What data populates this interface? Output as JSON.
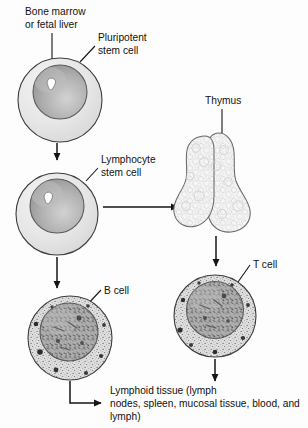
{
  "figure": {
    "background_color": "#fdfdfd",
    "line_color": "#1a1a1a"
  },
  "labels": {
    "bone_marrow_line1": "Bone marrow",
    "bone_marrow_line2": "or fetal liver",
    "pluripotent_line1": "Pluripotent",
    "pluripotent_line2": "stem cell",
    "lymphocyte_line1": "Lymphocyte",
    "lymphocyte_line2": "stem cell",
    "thymus": "Thymus",
    "b_cell": "B cell",
    "t_cell": "T cell",
    "lymphoid_line1": "Lymphoid tissue (lymph",
    "lymphoid_line2": "nodes, spleen, mucosal tissue, blood, and",
    "lymphoid_line3": "lymph)"
  },
  "cells": {
    "pluripotent_stem_cell": {
      "name": "Pluripotent stem cell",
      "cytoplasm_color": "#e8e8e8",
      "nucleus_color": "#a8a8a8",
      "nucleolus_color": "#fdfdfd"
    },
    "lymphocyte_stem_cell": {
      "name": "Lymphocyte stem cell",
      "cytoplasm_color": "#e8e8e8",
      "nucleus_color": "#a8a8a8",
      "nucleolus_color": "#fdfdfd"
    },
    "b_cell": {
      "name": "B cell",
      "cytoplasm_color": "#dcdcdc",
      "nucleus_color": "#a0a0a0",
      "granule_color": "#3a3a3a"
    },
    "t_cell": {
      "name": "T cell",
      "cytoplasm_color": "#dcdcdc",
      "nucleus_color": "#a0a0a0",
      "granule_color": "#3a3a3a"
    }
  },
  "organs": {
    "thymus": {
      "name": "Thymus",
      "fill_color": "#f4f4f4",
      "lobes": 2
    }
  },
  "flow": [
    {
      "from": "Pluripotent stem cell",
      "to": "Lymphocyte stem cell",
      "direction": "down"
    },
    {
      "from": "Lymphocyte stem cell",
      "to": "B cell",
      "direction": "down"
    },
    {
      "from": "Lymphocyte stem cell",
      "to": "Thymus",
      "direction": "right"
    },
    {
      "from": "Thymus",
      "to": "T cell",
      "direction": "down"
    },
    {
      "from": "B cell",
      "to": "Lymphoid tissue",
      "direction": "down-right"
    },
    {
      "from": "T cell",
      "to": "Lymphoid tissue",
      "direction": "down"
    }
  ]
}
